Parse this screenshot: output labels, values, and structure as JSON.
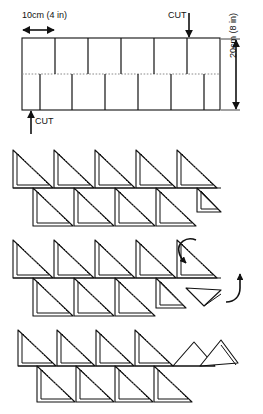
{
  "figure": {
    "type": "craft-instruction-diagram",
    "panels": [
      {
        "id": "panel-1",
        "name": "cut-template",
        "description": "Rectangular strip of paper marked with a dotted centre fold line and alternating slits cut from the top and bottom edges"
      },
      {
        "id": "panel-2",
        "name": "folded-zigzag-step-1",
        "description": "Strip folded into a row of triangular flaps, five pointing up and five pointing down"
      },
      {
        "id": "panel-3",
        "name": "folded-zigzag-step-2",
        "description": "Same row of triangles with curved arrows indicating the end flap being rolled over and turned up"
      },
      {
        "id": "panel-4",
        "name": "folded-zigzag-step-3",
        "description": "Result after the end flaps have been folded down flat"
      }
    ]
  },
  "labels": {
    "width": "10cm (4 in)",
    "height": "20cm (8 in)",
    "cut_top": "CUT",
    "cut_bottom": "CUT"
  },
  "icons": {
    "width_arrow": "double-headed-horizontal-arrow",
    "height_arrow": "double-headed-vertical-arrow",
    "cut_top_arrow": "down-arrow",
    "cut_bottom_arrow": "up-arrow",
    "fold_arrow_1": "curved-fold-arrow-down",
    "fold_arrow_2": "curved-fold-arrow-up"
  },
  "colors": {
    "ink": "#111111",
    "paper": "#ffffff",
    "fold_line": "#8a8a8a"
  },
  "template": {
    "rect": {
      "x": 22,
      "y": 38,
      "width": 198,
      "height": 72
    },
    "fold_line_y": 74,
    "top_slits_x": [
      55,
      88,
      121,
      154,
      187
    ],
    "bottom_slits_x": [
      40,
      72,
      105,
      138,
      171,
      204
    ]
  }
}
